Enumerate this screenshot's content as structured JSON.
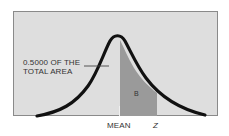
{
  "diagram": {
    "type": "normal-distribution-curve",
    "annotation": {
      "line1": "0.5000 OF THE",
      "line2": "TOTAL AREA"
    },
    "shaded_region_label": "B",
    "axis_labels": {
      "mean": "MEAN",
      "z": "Z"
    },
    "colors": {
      "background": "#dedede",
      "curve": "#111111",
      "shaded": "#9a9a9a",
      "frame_border": "#8a8a8a"
    }
  }
}
